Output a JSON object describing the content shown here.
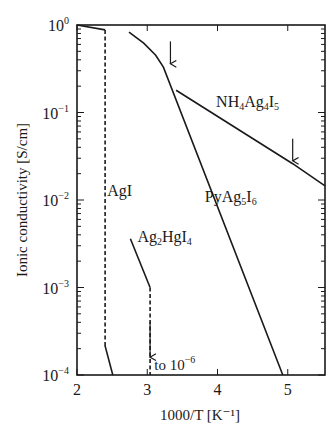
{
  "chart_data": {
    "type": "line",
    "title": "",
    "xlabel": "1000/T  [K⁻¹]",
    "ylabel": "Ionic conductivity  [S/cm]",
    "xscale": "linear",
    "yscale": "log",
    "xlim": [
      2.0,
      5.53
    ],
    "ylim": [
      0.0001,
      1.0
    ],
    "grid": false,
    "x_ticks": [
      {
        "value": 2,
        "label": "2"
      },
      {
        "value": 3,
        "label": "3"
      },
      {
        "value": 4,
        "label": "4"
      },
      {
        "value": 5,
        "label": "5"
      }
    ],
    "y_ticks": [
      {
        "value": 1.0,
        "base": "10",
        "exp": "0"
      },
      {
        "value": 0.1,
        "base": "10",
        "exp": "−1"
      },
      {
        "value": 0.01,
        "base": "10",
        "exp": "−2"
      },
      {
        "value": 0.001,
        "base": "10",
        "exp": "−3"
      },
      {
        "value": 0.0001,
        "base": "10",
        "exp": "−4"
      }
    ],
    "series": [
      {
        "name": "AgI",
        "label_parts": [
          {
            "t": "AgI"
          }
        ],
        "label_at": {
          "x": 2.43,
          "y": 0.011
        },
        "segments": [
          {
            "style": "solid",
            "points": [
              [
                2.0,
                1.0
              ],
              [
                2.4,
                0.88
              ]
            ]
          },
          {
            "style": "dashed",
            "points": [
              [
                2.4,
                0.88
              ],
              [
                2.4,
                0.000215
              ]
            ]
          },
          {
            "style": "solid",
            "points": [
              [
                2.4,
                0.000215
              ],
              [
                2.51,
                0.0001
              ]
            ]
          }
        ]
      },
      {
        "name": "Ag2HgI4",
        "label_parts": [
          {
            "t": "Ag"
          },
          {
            "t": "2",
            "sub": true
          },
          {
            "t": "HgI"
          },
          {
            "t": "4",
            "sub": true
          }
        ],
        "label_at": {
          "x": 2.86,
          "y": 0.0033
        },
        "segments": [
          {
            "style": "solid",
            "points": [
              [
                2.76,
                0.0036
              ],
              [
                3.04,
                0.001
              ]
            ]
          },
          {
            "style": "dashed",
            "points": [
              [
                3.04,
                0.001
              ],
              [
                3.04,
                0.0001
              ]
            ]
          }
        ],
        "arrows": [
          {
            "x": 3.04,
            "y_from": 0.0004,
            "y_to": 0.00016
          }
        ]
      },
      {
        "name": "PyAg5I6",
        "label_parts": [
          {
            "t": "PyAg"
          },
          {
            "t": "5",
            "sub": true
          },
          {
            "t": "I"
          },
          {
            "t": "6",
            "sub": true
          }
        ],
        "label_at": {
          "x": 3.82,
          "y": 0.0095
        },
        "segments": [
          {
            "style": "solid",
            "points": [
              [
                2.74,
                0.83
              ],
              [
                2.95,
                0.62
              ],
              [
                3.12,
                0.45
              ],
              [
                3.23,
                0.33
              ],
              [
                4.93,
                0.0001
              ]
            ]
          }
        ],
        "arrows": [
          {
            "x": 3.33,
            "y_from": 0.65,
            "y_to": 0.36
          }
        ]
      },
      {
        "name": "NH4Ag4I5",
        "label_parts": [
          {
            "t": "NH"
          },
          {
            "t": "4",
            "sub": true
          },
          {
            "t": "Ag"
          },
          {
            "t": "4",
            "sub": true
          },
          {
            "t": "I"
          },
          {
            "t": "5",
            "sub": true
          }
        ],
        "label_at": {
          "x": 3.98,
          "y": 0.115
        },
        "segments": [
          {
            "style": "solid",
            "points": [
              [
                3.41,
                0.18
              ],
              [
                5.07,
                0.026
              ],
              [
                5.53,
                0.0145
              ]
            ]
          }
        ],
        "arrows": [
          {
            "x": 5.07,
            "y_from": 0.05,
            "y_to": 0.028
          }
        ]
      }
    ],
    "annotations": [
      {
        "text": "to 10",
        "exp": "−6",
        "x": 3.1,
        "y": 0.000115
      }
    ]
  }
}
